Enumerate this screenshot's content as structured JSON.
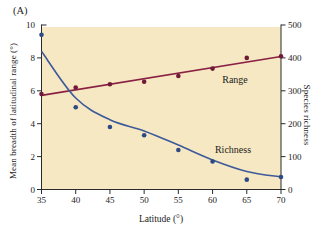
{
  "figure": {
    "panel_label": "(A)",
    "background": "#ffffff",
    "plot_background": "#f6e8c2",
    "axis_color": "#2b2b2b",
    "text_color": "#1b1b1b"
  },
  "chart_data": {
    "type": "scatter",
    "title": "",
    "grid": false,
    "legend": "inline-labels",
    "x_axis": {
      "label": "Latitude (°)",
      "range": [
        35,
        70
      ],
      "ticks": [
        35,
        40,
        45,
        50,
        55,
        60,
        65,
        70
      ]
    },
    "y_axis_left": {
      "label": "Mean breadth of latitudinal range (°)",
      "range": [
        0,
        10
      ],
      "ticks": [
        0,
        2,
        4,
        6,
        8,
        10
      ]
    },
    "y_axis_right": {
      "label": "Species richness",
      "range": [
        0,
        500
      ],
      "ticks": [
        0,
        100,
        200,
        300,
        400,
        500
      ]
    },
    "series": [
      {
        "name": "Range",
        "axis": "left",
        "line_color": "#8a2144",
        "dot_color": "#701a38",
        "fit": "linear",
        "points": [
          [
            35,
            5.8
          ],
          [
            40,
            6.2
          ],
          [
            45,
            6.4
          ],
          [
            50,
            6.55
          ],
          [
            55,
            6.9
          ],
          [
            60,
            7.35
          ],
          [
            65,
            8.0
          ],
          [
            70,
            8.1
          ]
        ],
        "fit_line": [
          [
            35,
            5.72
          ],
          [
            70,
            8.08
          ]
        ]
      },
      {
        "name": "Richness",
        "axis": "right",
        "line_color": "#3d5a9b",
        "dot_color": "#2e4a85",
        "fit": "exponential-decay",
        "points": [
          [
            35,
            470
          ],
          [
            40,
            250
          ],
          [
            45,
            190
          ],
          [
            50,
            165
          ],
          [
            55,
            120
          ],
          [
            60,
            85
          ],
          [
            65,
            30
          ],
          [
            70,
            38
          ]
        ],
        "fit_curve": [
          [
            35,
            420
          ],
          [
            40,
            278
          ],
          [
            45,
            212
          ],
          [
            50,
            178
          ],
          [
            55,
            135
          ],
          [
            60,
            90
          ],
          [
            65,
            55
          ],
          [
            70,
            38
          ]
        ]
      }
    ]
  }
}
